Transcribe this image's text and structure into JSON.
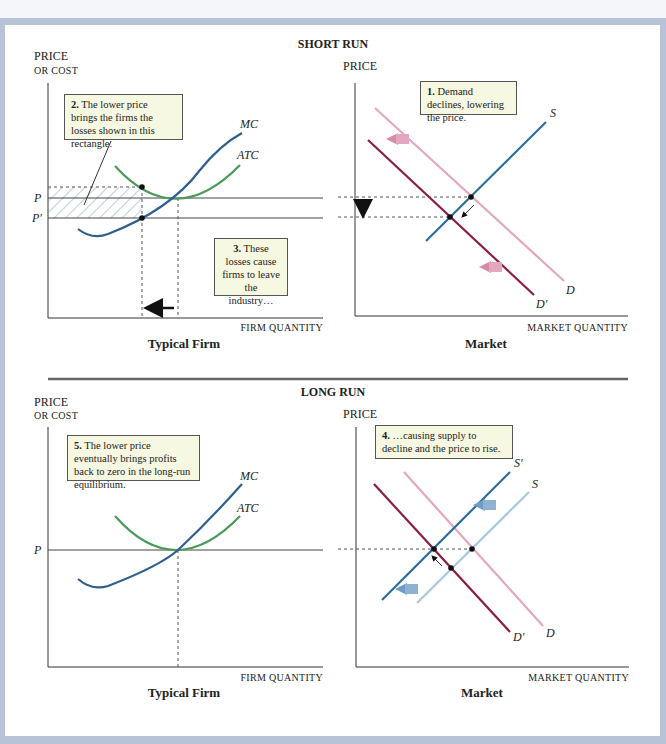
{
  "sections": {
    "short_run": "SHORT RUN",
    "long_run": "LONG RUN"
  },
  "short_run": {
    "firm": {
      "y_label_1": "Price",
      "y_label_2": "or cost",
      "x_label": "Firm quantity",
      "title": "Typical Firm",
      "curves": {
        "mc": "MC",
        "atc": "ATC"
      },
      "price_labels": {
        "p": "P",
        "p_prime": "P′"
      },
      "note_2_num": "2.",
      "note_2_text": "The lower price brings the firms the losses shown in this rectangle.",
      "note_3_num": "3.",
      "note_3_text": "These losses cause firms to leave the industry…"
    },
    "market": {
      "y_label": "Price",
      "x_label": "Market quantity",
      "title": "Market",
      "curves": {
        "s": "S",
        "d": "D",
        "d_prime": "D′"
      },
      "note_1_num": "1.",
      "note_1_text": "Demand declines, lowering the price."
    }
  },
  "long_run": {
    "firm": {
      "y_label_1": "Price",
      "y_label_2": "or cost",
      "x_label": "Firm quantity",
      "title": "Typical Firm",
      "curves": {
        "mc": "MC",
        "atc": "ATC"
      },
      "price_labels": {
        "p": "P"
      },
      "note_5_num": "5.",
      "note_5_text": "The lower price eventually brings profits back to zero in the long-run equilibrium."
    },
    "market": {
      "y_label": "Price",
      "x_label": "Market quantity",
      "title": "Market",
      "curves": {
        "s": "S",
        "s_prime": "S′",
        "d": "D",
        "d_prime": "D′"
      },
      "note_4_num": "4.",
      "note_4_text": "…causing supply to decline and the price to rise."
    }
  },
  "colors": {
    "frame": "#b9c3d8",
    "mc": "#2e5f8f",
    "atc": "#4a9a5a",
    "demand": "#e3a7bf",
    "demand_new": "#8a1f45",
    "supply": "#2e6d9e",
    "supply_old": "#a8c8e0",
    "note_bg": "#f7f8e1"
  }
}
